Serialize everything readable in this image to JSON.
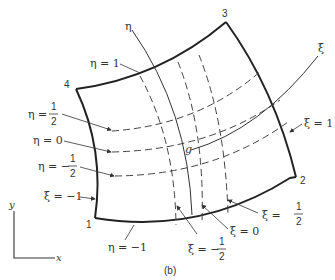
{
  "figure": {
    "caption": "(b)",
    "corners": [
      {
        "id": "1",
        "x": 95,
        "y": 218
      },
      {
        "id": "2",
        "x": 296,
        "y": 177
      },
      {
        "id": "3",
        "x": 226,
        "y": 22
      },
      {
        "id": "4",
        "x": 76,
        "y": 89
      }
    ],
    "axes": {
      "eta_label": "η",
      "xi_label": "ξ",
      "global_y": "y",
      "global_x": "x"
    },
    "center_point": "g",
    "eta_lines": [
      {
        "label_lhs": "η",
        "eq": "=",
        "value": "1",
        "frac": false
      },
      {
        "label_lhs": "η",
        "eq": "=",
        "num": "1",
        "den": "2",
        "sign": "",
        "frac": true
      },
      {
        "label_lhs": "η",
        "eq": "=",
        "value": "0",
        "frac": false
      },
      {
        "label_lhs": "η",
        "eq": "=",
        "num": "1",
        "den": "2",
        "sign": "−",
        "frac": true
      },
      {
        "label_lhs": "η",
        "eq": "=",
        "value": "−1",
        "frac": false
      }
    ],
    "xi_lines": [
      {
        "label_lhs": "ξ",
        "eq": "=",
        "value": "−1",
        "frac": false
      },
      {
        "label_lhs": "ξ",
        "eq": "=",
        "num": "1",
        "den": "2",
        "sign": "−",
        "frac": true
      },
      {
        "label_lhs": "ξ",
        "eq": "=",
        "value": "0",
        "frac": false
      },
      {
        "label_lhs": "ξ",
        "eq": "=",
        "num": "1",
        "den": "2",
        "sign": "",
        "frac": true
      },
      {
        "label_lhs": "ξ",
        "eq": "=",
        "value": "1",
        "frac": false
      }
    ]
  }
}
